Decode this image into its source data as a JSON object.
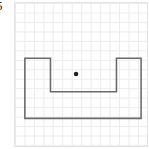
{
  "figure": {
    "problem_number": "5",
    "caption": "",
    "background_color": "#ffffff",
    "panel_border_color": "#e4e4e4"
  },
  "grid": {
    "name": "square-grid",
    "cell_size_px": 9.6,
    "columns": 14,
    "rows": 15,
    "line_color": "#ececec",
    "line_width": 1,
    "origin_x_px": 0.5,
    "origin_y_px": 0.5
  },
  "shape": {
    "name": "u-shaped-polygon",
    "description": "U-shaped rectilinear polygon (rectangle with a rectangular notch cut from the top center)",
    "stroke_color": "#6b6b6b",
    "stroke_width": 1.6,
    "fill": "none",
    "points_px": [
      [
        10,
        56
      ],
      [
        36,
        56
      ],
      [
        36,
        90
      ],
      [
        103,
        90
      ],
      [
        103,
        56
      ],
      [
        128,
        56
      ],
      [
        128,
        117
      ],
      [
        10,
        117
      ]
    ],
    "points_grid": [
      [
        1,
        5.5
      ],
      [
        3.7,
        5.5
      ],
      [
        3.7,
        9.3
      ],
      [
        10.7,
        9.3
      ],
      [
        10.7,
        5.5
      ],
      [
        13.3,
        5.5
      ],
      [
        13.3,
        12.1
      ],
      [
        1,
        12.1
      ]
    ]
  },
  "center_point": {
    "name": "center-dot",
    "x_px": 62,
    "y_px": 72,
    "radius_px": 2.3,
    "color": "#1f1f1f",
    "label": ""
  }
}
